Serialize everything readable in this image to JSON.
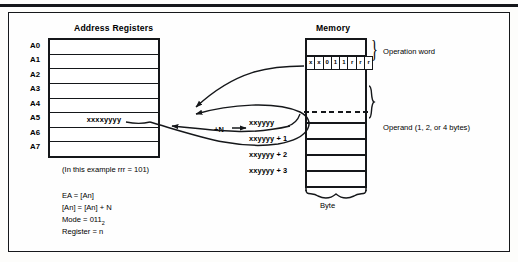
{
  "figure": {
    "registers_title": "Address Registers",
    "memory_title": "Memory",
    "register_labels": [
      "A0",
      "A1",
      "A2",
      "A3",
      "A4",
      "A5",
      "A6",
      "A7"
    ],
    "register_value": "xxxxyyyy",
    "register_value_row": 5,
    "operation_word_bits": [
      "x",
      "x",
      "0",
      "1",
      "1",
      "r",
      "r",
      "r"
    ],
    "operation_word_label": "Operation word",
    "operand_label": "Operand (1, 2, or 4 bytes)",
    "byte_label": "Byte",
    "increment_label": "+N",
    "memory_addresses": [
      "xxyyyy",
      "xxyyyy + 1",
      "xxyyyy + 2",
      "xxyyyy + 3"
    ],
    "example_note": "(In this example rrr = 101)",
    "formulas": [
      "EA = [An]",
      "[An] = [An] + N",
      "Mode = 011",
      "Register = n"
    ],
    "mode_subscript": "2",
    "colors": {
      "ink": "#15171a",
      "paper": "#fefefe"
    }
  }
}
